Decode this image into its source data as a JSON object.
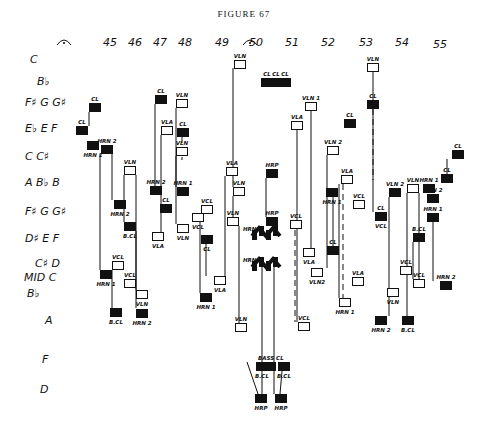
{
  "title": "FIGURE 67",
  "measures": [
    {
      "n": "45",
      "x": 110
    },
    {
      "n": "46",
      "x": 135
    },
    {
      "n": "47",
      "x": 160
    },
    {
      "n": "48",
      "x": 185
    },
    {
      "n": "49",
      "x": 222
    },
    {
      "n": "50",
      "x": 256
    },
    {
      "n": "51",
      "x": 292
    },
    {
      "n": "52",
      "x": 328
    },
    {
      "n": "53",
      "x": 366
    },
    {
      "n": "54",
      "x": 402
    },
    {
      "n": "55",
      "x": 440
    }
  ],
  "fermatas": [
    {
      "x": 64,
      "y": 40
    },
    {
      "x": 250,
      "y": 40
    }
  ],
  "pitches": [
    {
      "t": "C",
      "x": 30,
      "y": 53
    },
    {
      "t": "B♭",
      "x": 37,
      "y": 75
    },
    {
      "t": "F♯ G G♯",
      "x": 25,
      "y": 96
    },
    {
      "t": "E♭ E F",
      "x": 25,
      "y": 122
    },
    {
      "t": "C C♯",
      "x": 25,
      "y": 150
    },
    {
      "t": "A B♭ B",
      "x": 25,
      "y": 176
    },
    {
      "t": "F♯ G G♯",
      "x": 25,
      "y": 205
    },
    {
      "t": "D♯ E F",
      "x": 25,
      "y": 232
    },
    {
      "t": "C♯ D",
      "x": 35,
      "y": 257
    },
    {
      "t": "MID C",
      "x": 24,
      "y": 271
    },
    {
      "t": "B♭",
      "x": 27,
      "y": 287
    },
    {
      "t": "A",
      "x": 45,
      "y": 314
    },
    {
      "t": "F",
      "x": 42,
      "y": 353
    },
    {
      "t": "D",
      "x": 40,
      "y": 383
    }
  ],
  "notes": [
    {
      "l": "CL",
      "x": 89,
      "y": 103,
      "f": 1
    },
    {
      "l": "CL",
      "x": 76,
      "y": 126,
      "f": 1
    },
    {
      "l": "HRN 2",
      "x": 101,
      "y": 145,
      "f": 1
    },
    {
      "l": "HRN 1",
      "x": 87,
      "y": 141,
      "f": 1,
      "lb": 1
    },
    {
      "l": "HRN 2",
      "x": 114,
      "y": 200,
      "f": 1,
      "lb": 1
    },
    {
      "l": "B.CL",
      "x": 124,
      "y": 222,
      "f": 1,
      "lb": 1
    },
    {
      "l": "VLN",
      "x": 124,
      "y": 166,
      "f": 0
    },
    {
      "l": "HRN 1",
      "x": 100,
      "y": 270,
      "f": 1,
      "lb": 1
    },
    {
      "l": "VCL",
      "x": 112,
      "y": 261,
      "f": 0
    },
    {
      "l": "VCL",
      "x": 124,
      "y": 279,
      "f": 0
    },
    {
      "l": "B.CL",
      "x": 110,
      "y": 308,
      "f": 1,
      "lb": 1
    },
    {
      "l": "VLN",
      "x": 136,
      "y": 290,
      "f": 0,
      "lb": 1
    },
    {
      "l": "HRN 2",
      "x": 136,
      "y": 309,
      "f": 1,
      "lb": 1
    },
    {
      "l": "CL",
      "x": 155,
      "y": 95,
      "f": 1
    },
    {
      "l": "VLA",
      "x": 161,
      "y": 126,
      "f": 0
    },
    {
      "l": "VLN",
      "x": 176,
      "y": 147,
      "f": 0
    },
    {
      "l": "HRN 2",
      "x": 150,
      "y": 186,
      "f": 1
    },
    {
      "l": "CL",
      "x": 160,
      "y": 204,
      "f": 1
    },
    {
      "l": "VLA",
      "x": 152,
      "y": 232,
      "f": 0,
      "lb": 1
    },
    {
      "l": "VLN",
      "x": 177,
      "y": 224,
      "f": 0,
      "lb": 1
    },
    {
      "l": "VLN",
      "x": 176,
      "y": 99,
      "f": 0
    },
    {
      "l": "CL",
      "x": 177,
      "y": 128,
      "f": 1
    },
    {
      "l": "HRN 1",
      "x": 177,
      "y": 187,
      "f": 1
    },
    {
      "l": "VCL",
      "x": 201,
      "y": 205,
      "f": 0
    },
    {
      "l": "VCL",
      "x": 192,
      "y": 213,
      "f": 0,
      "lb": 1
    },
    {
      "l": "VLA",
      "x": 226,
      "y": 167,
      "f": 0
    },
    {
      "l": "VLN",
      "x": 233,
      "y": 187,
      "f": 0
    },
    {
      "l": "VLN",
      "x": 227,
      "y": 217,
      "f": 0
    },
    {
      "l": "CL",
      "x": 201,
      "y": 235,
      "f": 1,
      "lb": 1
    },
    {
      "l": "VLA",
      "x": 214,
      "y": 276,
      "f": 0,
      "lb": 1
    },
    {
      "l": "HRN 1",
      "x": 200,
      "y": 293,
      "f": 1,
      "lb": 1
    },
    {
      "l": "VLN",
      "x": 235,
      "y": 323,
      "f": 0
    },
    {
      "l": "VLN",
      "x": 234,
      "y": 60,
      "f": 0
    },
    {
      "l": "CL",
      "x": 261,
      "y": 78,
      "f": 1
    },
    {
      "l": "CL",
      "x": 270,
      "y": 78,
      "f": 1
    },
    {
      "l": "CL",
      "x": 279,
      "y": 78,
      "f": 1
    },
    {
      "l": "HRP",
      "x": 266,
      "y": 169,
      "f": 1
    },
    {
      "l": "HRP",
      "x": 266,
      "y": 217,
      "f": 1
    },
    {
      "l": "VCL",
      "x": 290,
      "y": 220,
      "f": 0
    },
    {
      "l": "VLA",
      "x": 291,
      "y": 121,
      "f": 0
    },
    {
      "l": "VLN 1",
      "x": 305,
      "y": 102,
      "f": 0
    },
    {
      "l": "VLA",
      "x": 303,
      "y": 248,
      "f": 0,
      "lb": 1
    },
    {
      "l": "VCL",
      "x": 298,
      "y": 322,
      "f": 0
    },
    {
      "l": "CL",
      "x": 344,
      "y": 119,
      "f": 1
    },
    {
      "l": "VLN 2",
      "x": 327,
      "y": 146,
      "f": 0
    },
    {
      "l": "HRN 1",
      "x": 326,
      "y": 188,
      "f": 1,
      "lb": 1
    },
    {
      "l": "CL",
      "x": 327,
      "y": 246,
      "f": 1
    },
    {
      "l": "VLN2",
      "x": 311,
      "y": 268,
      "f": 0,
      "lb": 1
    },
    {
      "l": "VLA",
      "x": 341,
      "y": 175,
      "f": 0
    },
    {
      "l": "VCL",
      "x": 353,
      "y": 200,
      "f": 0
    },
    {
      "l": "VLA",
      "x": 352,
      "y": 277,
      "f": 0
    },
    {
      "l": "HRN 1",
      "x": 339,
      "y": 298,
      "f": 0,
      "lb": 1
    },
    {
      "l": "VLN",
      "x": 367,
      "y": 63,
      "f": 0
    },
    {
      "l": "CL",
      "x": 367,
      "y": 100,
      "f": 1
    },
    {
      "l": "VCL",
      "x": 375,
      "y": 212,
      "f": 0,
      "lb": 1
    },
    {
      "l": "CL",
      "x": 375,
      "y": 212,
      "f": 1
    },
    {
      "l": "VLN 2",
      "x": 389,
      "y": 188,
      "f": 1
    },
    {
      "l": "VLN",
      "x": 407,
      "y": 184,
      "f": 0
    },
    {
      "l": "HRN 1",
      "x": 423,
      "y": 184,
      "f": 1
    },
    {
      "l": "HRN 2",
      "x": 427,
      "y": 194,
      "f": 1
    },
    {
      "l": "HRN 1",
      "x": 427,
      "y": 213,
      "f": 1
    },
    {
      "l": "B.CL",
      "x": 413,
      "y": 233,
      "f": 1
    },
    {
      "l": "VCL",
      "x": 400,
      "y": 266,
      "f": 0
    },
    {
      "l": "VCL",
      "x": 413,
      "y": 279,
      "f": 0
    },
    {
      "l": "VLN",
      "x": 387,
      "y": 288,
      "f": 0,
      "lb": 1
    },
    {
      "l": "HRN 2",
      "x": 375,
      "y": 316,
      "f": 1,
      "lb": 1
    },
    {
      "l": "B.CL",
      "x": 402,
      "y": 316,
      "f": 1,
      "lb": 1
    },
    {
      "l": "HRN 2",
      "x": 440,
      "y": 281,
      "f": 1
    },
    {
      "l": "CL",
      "x": 441,
      "y": 174,
      "f": 1
    },
    {
      "l": "CL",
      "x": 452,
      "y": 150,
      "f": 1
    },
    {
      "l": "BASS CL",
      "x": 264,
      "y": 362,
      "f": 1
    },
    {
      "l": "B.CL",
      "x": 256,
      "y": 362,
      "f": 1,
      "lb": 1
    },
    {
      "l": "B.CL",
      "x": 278,
      "y": 362,
      "f": 1,
      "lb": 1
    },
    {
      "l": "HRP",
      "x": 255,
      "y": 394,
      "f": 1,
      "lb": 1
    },
    {
      "l": "HRP",
      "x": 275,
      "y": 394,
      "f": 1,
      "lb": 1
    }
  ],
  "harp_labels": [
    {
      "t": "HRN 1",
      "x": 243,
      "y": 226
    },
    {
      "t": "HRN 2",
      "x": 243,
      "y": 257
    }
  ]
}
